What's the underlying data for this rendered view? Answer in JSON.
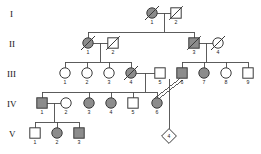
{
  "figure": {
    "type": "pedigree-chart",
    "title": "",
    "width": 261,
    "height": 154,
    "background": "#ffffff",
    "line_color": "#4a4a4a",
    "affected_fill": "#8c8c8c",
    "unaffected_fill": "#ffffff",
    "symbol_stroke": "#3a3a3a"
  },
  "legend_semantics": {
    "square": "male",
    "circle": "female",
    "diamond": "unknown-sex / unborn",
    "filled": "affected",
    "open": "unaffected",
    "slash": "deceased",
    "double-line": "consanguineous-mating"
  },
  "generations": [
    {
      "label": "I",
      "label_x": 10,
      "label_y": 14
    },
    {
      "label": "II",
      "label_x": 9,
      "label_y": 44
    },
    {
      "label": "III",
      "label_x": 7,
      "label_y": 74
    },
    {
      "label": "IV",
      "label_x": 7,
      "label_y": 104
    },
    {
      "label": "V",
      "label_x": 9,
      "label_y": 134
    }
  ],
  "individuals": [
    {
      "id": "I-1",
      "gen": "I",
      "num": "1",
      "sex": "female",
      "shape": "circle",
      "affected": true,
      "deceased": true,
      "cx": 152,
      "cy": 13
    },
    {
      "id": "I-2",
      "gen": "I",
      "num": "2",
      "sex": "male",
      "shape": "square",
      "affected": false,
      "deceased": true,
      "cx": 176,
      "cy": 13
    },
    {
      "id": "II-1",
      "gen": "II",
      "num": "1",
      "sex": "female",
      "shape": "circle",
      "affected": true,
      "deceased": true,
      "cx": 88,
      "cy": 43
    },
    {
      "id": "II-2",
      "gen": "II",
      "num": "2",
      "sex": "male",
      "shape": "square",
      "affected": false,
      "deceased": true,
      "cx": 113,
      "cy": 43
    },
    {
      "id": "II-3",
      "gen": "II",
      "num": "3",
      "sex": "male",
      "shape": "square",
      "affected": true,
      "deceased": true,
      "cx": 194,
      "cy": 43
    },
    {
      "id": "II-4",
      "gen": "II",
      "num": "4",
      "sex": "female",
      "shape": "circle",
      "affected": false,
      "deceased": true,
      "cx": 218,
      "cy": 43
    },
    {
      "id": "III-1",
      "gen": "III",
      "num": "1",
      "sex": "female",
      "shape": "circle",
      "affected": false,
      "deceased": false,
      "cx": 65,
      "cy": 73
    },
    {
      "id": "III-2",
      "gen": "III",
      "num": "2",
      "sex": "female",
      "shape": "circle",
      "affected": false,
      "deceased": false,
      "cx": 87,
      "cy": 73
    },
    {
      "id": "III-3",
      "gen": "III",
      "num": "3",
      "sex": "female",
      "shape": "circle",
      "affected": false,
      "deceased": false,
      "cx": 109,
      "cy": 73
    },
    {
      "id": "III-4",
      "gen": "III",
      "num": "4",
      "sex": "female",
      "shape": "circle",
      "affected": true,
      "deceased": true,
      "cx": 131,
      "cy": 73
    },
    {
      "id": "III-5",
      "gen": "III",
      "num": "5",
      "sex": "male",
      "shape": "square",
      "affected": false,
      "deceased": false,
      "cx": 160,
      "cy": 73
    },
    {
      "id": "III-6",
      "gen": "III",
      "num": "6",
      "sex": "male",
      "shape": "square",
      "affected": true,
      "deceased": false,
      "cx": 182,
      "cy": 73
    },
    {
      "id": "III-7",
      "gen": "III",
      "num": "7",
      "sex": "female",
      "shape": "circle",
      "affected": true,
      "deceased": false,
      "cx": 204,
      "cy": 73
    },
    {
      "id": "III-8",
      "gen": "III",
      "num": "8",
      "sex": "female",
      "shape": "circle",
      "affected": false,
      "deceased": false,
      "cx": 226,
      "cy": 73
    },
    {
      "id": "III-9",
      "gen": "III",
      "num": "9",
      "sex": "male",
      "shape": "square",
      "affected": false,
      "deceased": false,
      "cx": 248,
      "cy": 73
    },
    {
      "id": "IV-1",
      "gen": "IV",
      "num": "1",
      "sex": "male",
      "shape": "square",
      "affected": true,
      "deceased": false,
      "cx": 42,
      "cy": 103
    },
    {
      "id": "IV-2",
      "gen": "IV",
      "num": "2",
      "sex": "female",
      "shape": "circle",
      "affected": false,
      "deceased": false,
      "cx": 66,
      "cy": 103
    },
    {
      "id": "IV-3",
      "gen": "IV",
      "num": "3",
      "sex": "female",
      "shape": "circle",
      "affected": true,
      "deceased": false,
      "cx": 89,
      "cy": 103
    },
    {
      "id": "IV-4",
      "gen": "IV",
      "num": "4",
      "sex": "female",
      "shape": "circle",
      "affected": true,
      "deceased": false,
      "cx": 111,
      "cy": 103
    },
    {
      "id": "IV-5",
      "gen": "IV",
      "num": "5",
      "sex": "male",
      "shape": "square",
      "affected": false,
      "deceased": false,
      "cx": 133,
      "cy": 103
    },
    {
      "id": "IV-6",
      "gen": "IV",
      "num": "6",
      "sex": "female",
      "shape": "circle",
      "affected": true,
      "deceased": false,
      "cx": 157,
      "cy": 103
    },
    {
      "id": "V-1",
      "gen": "V",
      "num": "1",
      "sex": "male",
      "shape": "square",
      "affected": false,
      "deceased": false,
      "cx": 35,
      "cy": 133
    },
    {
      "id": "V-2",
      "gen": "V",
      "num": "2",
      "sex": "female",
      "shape": "circle",
      "affected": true,
      "deceased": false,
      "cx": 57,
      "cy": 133
    },
    {
      "id": "V-3",
      "gen": "V",
      "num": "3",
      "sex": "male",
      "shape": "square",
      "affected": true,
      "deceased": false,
      "cx": 79,
      "cy": 133
    },
    {
      "id": "V-4",
      "gen": "V",
      "num": "4",
      "sex": "unknown",
      "shape": "diamond",
      "affected": false,
      "deceased": false,
      "cx": 169,
      "cy": 136
    }
  ],
  "matings": [
    {
      "id": "m-I",
      "partners": [
        "I-1",
        "I-2"
      ],
      "consanguineous": false
    },
    {
      "id": "m-II-a",
      "partners": [
        "II-1",
        "II-2"
      ],
      "consanguineous": false
    },
    {
      "id": "m-II-b",
      "partners": [
        "II-3",
        "II-4"
      ],
      "consanguineous": false
    },
    {
      "id": "m-III-a",
      "partners": [
        "III-4",
        "III-5"
      ],
      "consanguineous": false
    },
    {
      "id": "m-IV-a",
      "partners": [
        "IV-1",
        "IV-2"
      ],
      "consanguineous": false
    },
    {
      "id": "m-cons",
      "partners": [
        "III-6",
        "IV-6"
      ],
      "consanguineous": true
    }
  ],
  "sibships": [
    {
      "parents": "m-I",
      "children": [
        "II-1",
        "II-3"
      ]
    },
    {
      "parents": "m-II-a",
      "children": [
        "III-1",
        "III-2",
        "III-3",
        "III-4"
      ]
    },
    {
      "parents": "m-II-b",
      "children": [
        "III-6",
        "III-7",
        "III-8",
        "III-9"
      ]
    },
    {
      "parents": "m-III-a",
      "children": [
        "IV-1",
        "IV-3",
        "IV-4",
        "IV-5",
        "IV-6"
      ]
    },
    {
      "parents": "m-IV-a",
      "children": [
        "V-1",
        "V-2",
        "V-3"
      ]
    },
    {
      "parents": "m-cons",
      "children": [
        "V-4"
      ]
    }
  ],
  "labels": {
    "gen1": "I",
    "gen2": "II",
    "gen3": "III",
    "gen4": "IV",
    "gen5": "V",
    "diamond_count": "4"
  }
}
